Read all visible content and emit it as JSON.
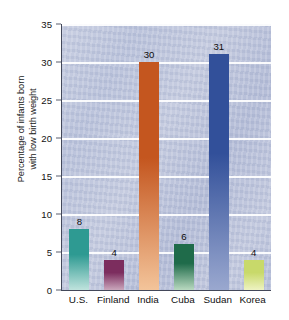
{
  "chart_data": {
    "type": "bar",
    "title": "",
    "xlabel": "",
    "ylabel_line1": "Percentage of infants born",
    "ylabel_line2": "with low birth weight",
    "ylabel": "Percentage of infants born with low birth weight",
    "categories": [
      "U.S.",
      "Finland",
      "India",
      "Cuba",
      "Sudan",
      "Korea"
    ],
    "values": [
      8,
      4,
      30,
      6,
      31,
      4
    ],
    "value_labels": [
      "8",
      "4",
      "30",
      "6",
      "31",
      "4"
    ],
    "ylim": [
      0,
      35
    ],
    "yticks": [
      0,
      5,
      10,
      15,
      20,
      25,
      30,
      35
    ],
    "ytick_labels": [
      "0",
      "5",
      "10",
      "15",
      "20",
      "25",
      "30",
      "35"
    ],
    "grid": "horizontal",
    "legend": "none",
    "bar_colors": [
      "#2e9a92",
      "#7c2d5e",
      "#c4561f",
      "#1f6b4a",
      "#32509a",
      "#c8d96a"
    ],
    "bar_colors_bottom": [
      "#bfe3dd",
      "#caa7bc",
      "#f3c49a",
      "#b9d9c0",
      "#9aa8cf",
      "#eef3c2"
    ],
    "plot_background": "#c2c9de",
    "gridline_color": "#ffffff",
    "axis_color": "#43485a",
    "page_background": "#ffffff",
    "series": [
      {
        "name": "Percentage of infants born with low birth weight",
        "points": [
          {
            "category": "U.S.",
            "value": 8,
            "color": "#2e9a92"
          },
          {
            "category": "Finland",
            "value": 4,
            "color": "#7c2d5e"
          },
          {
            "category": "India",
            "value": 30,
            "color": "#c4561f"
          },
          {
            "category": "Cuba",
            "value": 6,
            "color": "#1f6b4a"
          },
          {
            "category": "Sudan",
            "value": 31,
            "color": "#32509a"
          },
          {
            "category": "Korea",
            "value": 4,
            "color": "#c8d96a"
          }
        ]
      }
    ]
  }
}
